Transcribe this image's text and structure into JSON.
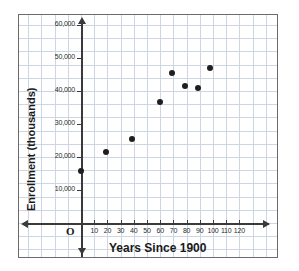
{
  "chart_data": {
    "type": "scatter",
    "title": "",
    "xlabel": "Years Since 1900",
    "ylabel": "Enrollment (thousands)",
    "origin_label": "O",
    "xlim": [
      0,
      125
    ],
    "ylim": [
      0,
      65000
    ],
    "xticks": [
      10,
      20,
      30,
      40,
      50,
      60,
      70,
      80,
      90,
      100,
      110,
      120
    ],
    "xtick_labels": [
      "10",
      "20",
      "30",
      "40",
      "50",
      "60",
      "70",
      "80",
      "90",
      "100",
      "110",
      "120"
    ],
    "yticks": [
      10000,
      20000,
      30000,
      40000,
      50000,
      60000
    ],
    "ytick_labels": [
      "10,000",
      "20,000",
      "30,000",
      "40,000",
      "50,000",
      "60,000"
    ],
    "grid": true,
    "grid_color": "#ccd6e4",
    "axis_color": "#3a3a3a",
    "point_color": "#1f1f1f",
    "legend": null,
    "points": [
      {
        "x": 0,
        "y": 15700
      },
      {
        "x": 19,
        "y": 21400
      },
      {
        "x": 39,
        "y": 25500
      },
      {
        "x": 60,
        "y": 36700
      },
      {
        "x": 69,
        "y": 45500
      },
      {
        "x": 79,
        "y": 41400
      },
      {
        "x": 89,
        "y": 41000
      },
      {
        "x": 98,
        "y": 47000
      }
    ]
  }
}
